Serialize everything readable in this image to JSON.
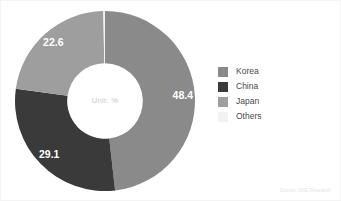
{
  "chart_data": {
    "type": "pie",
    "variant": "donut",
    "title": "",
    "subtitle": "",
    "xlabel": "",
    "ylabel": "",
    "unit_note": "Unit: %",
    "grid": false,
    "legend_position": "right",
    "start_angle_deg": 0,
    "direction": "clockwise",
    "inner_radius_ratio": 0.42,
    "categories": [
      "Korea",
      "China",
      "Japan",
      "Others"
    ],
    "values": [
      48.4,
      29.1,
      22.6,
      0.3
    ],
    "value_labels": [
      "48.4",
      "29.1",
      "22.6",
      ""
    ],
    "colors": [
      "#8a8a8a",
      "#3a3a3a",
      "#9e9e9e",
      "#f2f2f2"
    ],
    "slices": [
      {
        "name": "Korea",
        "value": 48.4,
        "label": "48.4",
        "color": "#8a8a8a",
        "label_color": "#ffffff"
      },
      {
        "name": "China",
        "value": 29.1,
        "label": "29.1",
        "color": "#3a3a3a",
        "label_color": "#ffffff"
      },
      {
        "name": "Japan",
        "value": 22.6,
        "label": "22.6",
        "color": "#9e9e9e",
        "label_color": "#ffffff"
      },
      {
        "name": "Others",
        "value": 0.3,
        "label": "",
        "color": "#f2f2f2",
        "label_color": "#8a8a8a"
      }
    ]
  },
  "legend": {
    "items": [
      {
        "label": "Korea",
        "color": "#8a8a8a"
      },
      {
        "label": "China",
        "color": "#3a3a3a"
      },
      {
        "label": "Japan",
        "color": "#9e9e9e"
      },
      {
        "label": "Others",
        "color": "#f2f2f2"
      }
    ]
  },
  "center": {
    "text": "Unit: %"
  },
  "footer": {
    "source": "Source: SNE Research"
  }
}
